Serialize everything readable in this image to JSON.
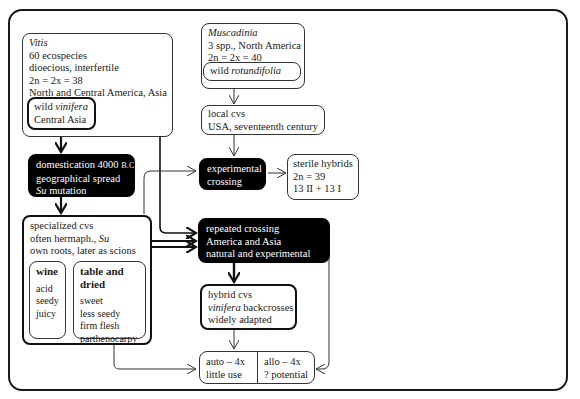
{
  "diagram": {
    "nodes": {
      "vitis": {
        "title": "Vitis",
        "lines": [
          "60 ecospecies",
          "dioecious, interfertile",
          "2n = 2x = 38",
          "North and Central America, Asia"
        ]
      },
      "wild_vinifera": {
        "prefix": "wild ",
        "italic": "vinifera",
        "line2": "Central Asia"
      },
      "muscadinia": {
        "title": "Muscadinia",
        "lines": [
          "3 spp., North America",
          "2n = 2x = 40"
        ]
      },
      "wild_rotundifolia": {
        "prefix": "wild ",
        "italic": "rotundifolia"
      },
      "local_cvs": {
        "lines": [
          "local cvs",
          "USA, seventeenth  century"
        ]
      },
      "domestication": {
        "line1_text": "domestication 4000 ",
        "line1_sc": "B.C.",
        "line2": "geographical spread",
        "line3_italic": "Su",
        "line3_rest": "  mutation"
      },
      "experimental_crossing": {
        "lines": [
          "experimental",
          "crossing"
        ]
      },
      "sterile_hybrids": {
        "lines": [
          "sterile hybrids",
          "2n = 39",
          "13 II + 13 I"
        ]
      },
      "specialized_cvs": {
        "line1": "specialized cvs",
        "line2_text": "often hermaph., ",
        "line2_italic": "Su",
        "line3": "own roots, later as scions"
      },
      "wine": {
        "heading": "wine",
        "items": [
          "acid",
          "seedy",
          "juicy"
        ]
      },
      "table_dried": {
        "heading": "table and dried",
        "items": [
          "sweet",
          "less seedy",
          "firm flesh",
          "parthenocarpy"
        ]
      },
      "repeated_crossing": {
        "lines": [
          "repeated crossing",
          "America and Asia",
          "natural and experimental"
        ]
      },
      "hybrid_cvs": {
        "line1": "hybrid cvs",
        "line2_italic": "vinifera",
        "line2_rest": " backcrosses",
        "line3": "widely adapted"
      },
      "polyploid": {
        "auto": [
          "auto – 4x",
          "little use"
        ],
        "allo": [
          "allo – 4x",
          "? potential"
        ]
      }
    },
    "edges": [
      {
        "from": "wild_vinifera",
        "to": "domestication",
        "style": "thick"
      },
      {
        "from": "vitis",
        "to": "repeated_crossing",
        "style": "thin"
      },
      {
        "from": "wild_rotundifolia",
        "to": "local_cvs",
        "style": "thin"
      },
      {
        "from": "local_cvs",
        "to": "experimental_crossing",
        "style": "thin"
      },
      {
        "from": "specialized_cvs",
        "to": "experimental_crossing",
        "style": "thin"
      },
      {
        "from": "experimental_crossing",
        "to": "sterile_hybrids",
        "style": "thin"
      },
      {
        "from": "domestication",
        "to": "specialized_cvs",
        "style": "thick"
      },
      {
        "from": "specialized_cvs",
        "to": "repeated_crossing",
        "style": "thick"
      },
      {
        "from": "repeated_crossing",
        "to": "hybrid_cvs",
        "style": "thick"
      },
      {
        "from": "hybrid_cvs",
        "to": "polyploid",
        "style": "thin"
      },
      {
        "from": "specialized_cvs",
        "to": "polyploid",
        "style": "thin"
      },
      {
        "from": "repeated_crossing",
        "to": "polyploid",
        "style": "thin"
      }
    ]
  }
}
